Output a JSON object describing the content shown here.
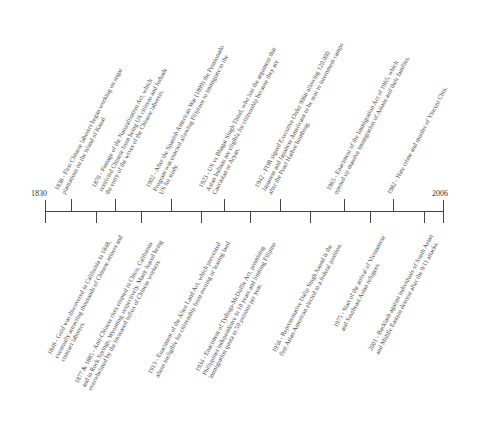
{
  "timeline": {
    "start_year": "1830",
    "end_year": "2006",
    "events_above": [
      {
        "year": 1838,
        "lines": [
          "1838 - First Chinese laborers began working on sugar",
          "plantations on the island of Kauai."
        ]
      },
      {
        "year": 1870,
        "lines": [
          "1870 - Passage of the Naturalization Act, which",
          "restricted Chinese from being US citizens and forbade",
          "the entry of the wives of the Chinese laborers."
        ]
      },
      {
        "year": 1902,
        "lines": [
          "1902 - After the Spanish American War (1899) the Pensionado",
          "Program was enacted allowing Filipinos to immigrate to the",
          "US for study."
        ]
      },
      {
        "year": 1923,
        "lines": [
          "1923 - US vs Bhagat Singh Thind, who lost the argument that",
          "Asian Indians are eligible for citizenship because they are",
          "Caucasian or Aryan."
        ]
      },
      {
        "year": 1942,
        "lines": [
          "1942 - FDR signed Executive Order 9066 allowing 120,000",
          "Japanese and Japanese Americans to be sent to internment camps",
          "after the Pearl Harbor bombing."
        ]
      },
      {
        "year": 1965,
        "lines": [
          "1965 - Enactment of the Immigration Act of 1965, which",
          "opened up massive immigration of Asians and their families."
        ]
      },
      {
        "year": 1982,
        "lines": [
          "1982 - Hate crime and murder of Vincent Chin."
        ]
      }
    ],
    "events_below": [
      {
        "year": 1848,
        "lines": [
          "1848 - Gold was discovered in California in 1848,",
          "eventually attracting thousands of Chinese miners and",
          "contract laborers."
        ]
      },
      {
        "year": 1877,
        "lines": [
          "1877 & 1885 - Anti-Chinese riots erupted in Chico, California",
          "and in Rock Springs, Wyoming, respectively. Many feared being",
          "overwhelmed by the increased influx of Chinese workers."
        ]
      },
      {
        "year": 1913,
        "lines": [
          "1913 - Enactment of the Alien Land Act, which prevented",
          "aliens ineligible for citizenship from owning or leasing land."
        ]
      },
      {
        "year": 1934,
        "lines": [
          "1934 - Enactment of Tydings-McDuffie Act, promising",
          "Philippines independence in 10 years and limiting Filipino",
          "immigration quota to 50 persons per year."
        ]
      },
      {
        "year": 1956,
        "lines": [
          "1956 - Representative Dalip Singh Saund is the",
          "first Asian American elected to a federal position."
        ]
      },
      {
        "year": 1975,
        "lines": [
          "1975 - Start of the arrival of Vietnamese",
          "and Southeast Asian refugees."
        ]
      },
      {
        "year": 2001,
        "lines": [
          "2001 - Backlash against individuals of South Asian",
          "and Middle Eastern descent after the 9/11 attacks."
        ]
      }
    ]
  }
}
